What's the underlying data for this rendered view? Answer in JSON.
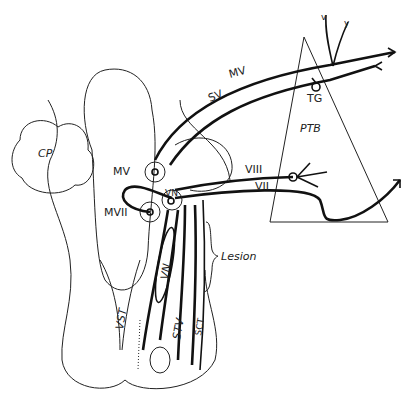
{
  "diagram": {
    "type": "anatomical schematic (brainstem, cranial nerve pathways)",
    "labels": {
      "cp": "CP",
      "ptb": "PTB",
      "tg": "TG",
      "mv_tract": "MV",
      "sv_tract": "SV",
      "viii": "VIII",
      "vii": "VII",
      "mv_nucleus": "MV",
      "mvii_nucleus": "MVII",
      "vn": "VN",
      "lesion": "Lesion",
      "vst": "VST",
      "vn_column": "VN",
      "stv": "STV",
      "sct": "SCT"
    }
  }
}
